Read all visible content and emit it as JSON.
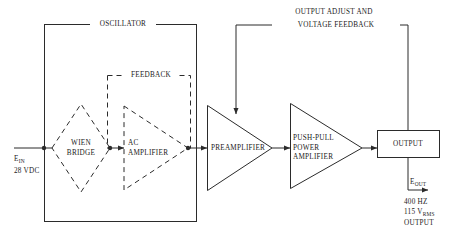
{
  "diagram": {
    "type": "block-diagram",
    "stroke_color": "#2b2b2b",
    "background_color": "#ffffff",
    "sections": {
      "oscillator": {
        "label": "OSCILLATOR",
        "border": "solid"
      },
      "feedback": {
        "label": "FEEDBACK",
        "border": "dashed"
      }
    },
    "blocks": {
      "wien_bridge": {
        "label_line1": "WIEN",
        "label_line2": "BRIDGE",
        "shape": "diamond",
        "border": "dashed"
      },
      "ac_amplifier": {
        "label_line1": "AC",
        "label_line2": "AMPLIFIER",
        "shape": "triangle",
        "border": "dashed"
      },
      "preamplifier": {
        "label": "PREAMPLIFIER",
        "shape": "triangle",
        "border": "solid"
      },
      "push_pull": {
        "label_line1": "PUSH-PULL",
        "label_line2": "POWER",
        "label_line3": "AMPLIFIER",
        "shape": "triangle",
        "border": "solid"
      },
      "output": {
        "label": "OUTPUT",
        "shape": "rectangle",
        "border": "solid"
      }
    },
    "feedback_path": {
      "line1": "OUTPUT ADJUST AND",
      "line2": "VOLTAGE FEEDBACK"
    },
    "input": {
      "symbol": "E",
      "subscript": "IN",
      "spec": "28 VDC"
    },
    "output": {
      "symbol": "E",
      "subscript": "OUT",
      "spec_line1": "400 HZ",
      "spec_line2_value": "115 V",
      "spec_line2_sub": "RMS",
      "spec_line3": "OUTPUT"
    }
  }
}
